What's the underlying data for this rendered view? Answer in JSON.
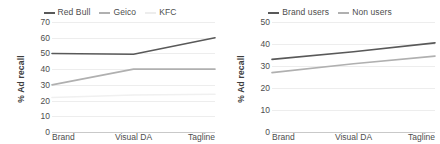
{
  "chart_data": [
    {
      "type": "line",
      "title": "",
      "xlabel": "",
      "ylabel": "% Ad recall",
      "categories": [
        "Brand",
        "Visual DA",
        "Tagline"
      ],
      "ylim": [
        0,
        70
      ],
      "yticks": [
        0,
        10,
        20,
        30,
        40,
        50,
        60,
        70
      ],
      "grid": true,
      "legend_position": "top-center",
      "series": [
        {
          "name": "Red Bull",
          "values": [
            50,
            49.5,
            60
          ],
          "color": "#595959"
        },
        {
          "name": "Geico",
          "values": [
            30,
            40,
            40
          ],
          "color": "#b0b0b0"
        },
        {
          "name": "KFC",
          "values": [
            22,
            23.5,
            24
          ],
          "color": "#f0f0f0"
        }
      ]
    },
    {
      "type": "line",
      "title": "",
      "xlabel": "",
      "ylabel": "% Ad recall",
      "categories": [
        "Brand",
        "Visual DA",
        "Tagline"
      ],
      "ylim": [
        0,
        50
      ],
      "yticks": [
        0,
        10,
        20,
        30,
        40,
        50
      ],
      "grid": true,
      "legend_position": "top-center",
      "series": [
        {
          "name": "Brand users",
          "values": [
            33,
            36.5,
            40.5
          ],
          "color": "#595959"
        },
        {
          "name": "Non users",
          "values": [
            27,
            31,
            34.5
          ],
          "color": "#b0b0b0"
        }
      ]
    }
  ],
  "left_panel": {
    "ylabel": "% Ad recall",
    "legend": [
      {
        "label": "Red Bull",
        "color": "#595959"
      },
      {
        "label": "Geico",
        "color": "#b0b0b0"
      },
      {
        "label": "KFC",
        "color": "#ededed"
      }
    ],
    "yticks": [
      "70",
      "60",
      "50",
      "40",
      "30",
      "20",
      "10",
      "0"
    ],
    "xticks": [
      "Brand",
      "Visual DA",
      "Tagline"
    ]
  },
  "right_panel": {
    "ylabel": "% Ad recall",
    "legend": [
      {
        "label": "Brand users",
        "color": "#595959"
      },
      {
        "label": "Non users",
        "color": "#b0b0b0"
      }
    ],
    "yticks": [
      "50",
      "40",
      "30",
      "20",
      "10",
      "0"
    ],
    "xticks": [
      "Brand",
      "Visual DA",
      "Tagline"
    ]
  }
}
